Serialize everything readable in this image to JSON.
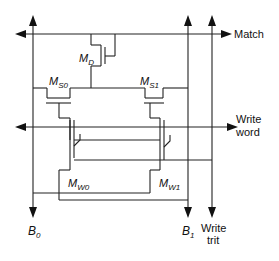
{
  "diagram": {
    "type": "circuit-schematic",
    "signals": {
      "match": "Match",
      "write_word_line1": "Write",
      "write_word_line2": "word",
      "write_trit_line1": "Write",
      "write_trit_line2": "trit"
    },
    "bitlines": {
      "b0_main": "B",
      "b0_sub": "0",
      "b1_main": "B",
      "b1_sub": "1"
    },
    "transistors": {
      "md_main": "M",
      "md_sub": "D",
      "ms0_main": "M",
      "ms0_sub": "S0",
      "ms1_main": "M",
      "ms1_sub": "S1",
      "mw0_main": "M",
      "mw0_sub": "W0",
      "mw1_main": "M",
      "mw1_sub": "W1"
    }
  }
}
